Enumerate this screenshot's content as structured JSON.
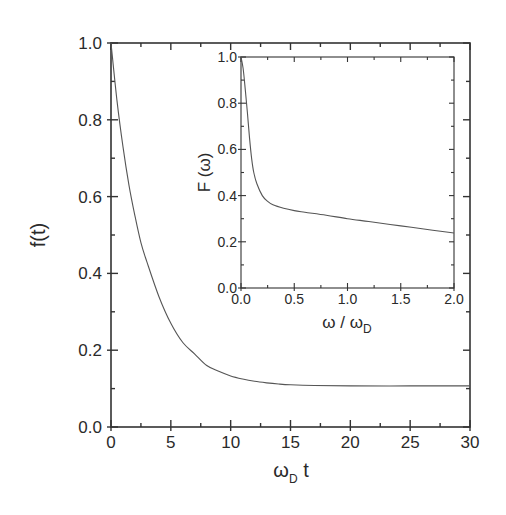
{
  "chart_data": [
    {
      "id": "main",
      "type": "line",
      "title": "",
      "xlabel": "ωD t",
      "xlabel_parts": {
        "main": "ω",
        "sub": "D",
        "suffix": " t"
      },
      "ylabel": "f(t)",
      "xlim": [
        0,
        30
      ],
      "ylim": [
        0.0,
        1.0
      ],
      "xticks": [
        0,
        5,
        10,
        15,
        20,
        25,
        30
      ],
      "xtick_labels": [
        "0",
        "5",
        "10",
        "15",
        "20",
        "25",
        "30"
      ],
      "yticks": [
        0.0,
        0.2,
        0.4,
        0.6,
        0.8,
        1.0
      ],
      "ytick_labels": [
        "0.0",
        "0.2",
        "0.4",
        "0.6",
        "0.8",
        "1.0"
      ],
      "grid": false,
      "legend": null,
      "series": [
        {
          "name": "f(t)",
          "color": "#555555",
          "x": [
            0,
            0.5,
            1,
            1.5,
            2,
            2.5,
            3,
            4,
            5,
            6,
            7,
            8,
            9,
            10,
            11,
            12,
            13,
            14,
            15,
            17,
            20,
            25,
            30
          ],
          "y": [
            1.0,
            0.85,
            0.73,
            0.63,
            0.55,
            0.48,
            0.43,
            0.34,
            0.27,
            0.22,
            0.19,
            0.16,
            0.145,
            0.133,
            0.125,
            0.119,
            0.115,
            0.112,
            0.11,
            0.108,
            0.107,
            0.107,
            0.107
          ]
        }
      ]
    },
    {
      "id": "inset",
      "type": "line",
      "title": "",
      "xlabel": "ω / ωD",
      "xlabel_parts": {
        "main": "ω / ω",
        "sub": "D"
      },
      "ylabel": "F (ω)",
      "xlim": [
        0.0,
        2.0
      ],
      "ylim": [
        0.0,
        1.0
      ],
      "xticks": [
        0.0,
        0.5,
        1.0,
        1.5,
        2.0
      ],
      "xtick_labels": [
        "0.0",
        "0.5",
        "1.0",
        "1.5",
        "2.0"
      ],
      "yticks": [
        0.0,
        0.2,
        0.4,
        0.6,
        0.8,
        1.0
      ],
      "ytick_labels": [
        "0.0",
        "0.2",
        "0.4",
        "0.6",
        "0.8",
        "1.0"
      ],
      "grid": false,
      "legend": null,
      "series": [
        {
          "name": "F(ω)",
          "color": "#555555",
          "x": [
            0.0,
            0.02,
            0.04,
            0.06,
            0.08,
            0.1,
            0.12,
            0.15,
            0.2,
            0.25,
            0.3,
            0.4,
            0.5,
            0.6,
            0.8,
            1.0,
            1.2,
            1.4,
            1.6,
            1.8,
            2.0
          ],
          "y": [
            1.0,
            0.95,
            0.86,
            0.76,
            0.65,
            0.56,
            0.5,
            0.45,
            0.4,
            0.375,
            0.36,
            0.345,
            0.335,
            0.328,
            0.315,
            0.3,
            0.288,
            0.275,
            0.263,
            0.25,
            0.238
          ]
        }
      ]
    }
  ]
}
